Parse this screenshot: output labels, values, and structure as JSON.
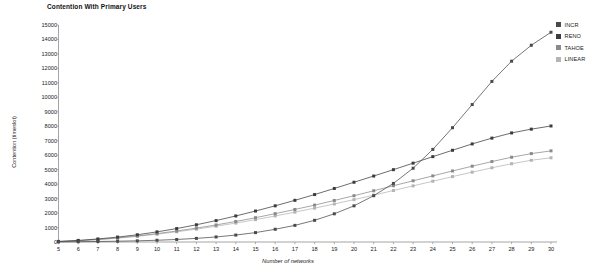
{
  "chart_data": {
    "type": "line",
    "title": "Contention With Primary Users",
    "xlabel": "Number of networks",
    "ylabel": "Contention (timeslot)",
    "xlim": [
      5,
      30
    ],
    "ylim": [
      0,
      15000
    ],
    "ytick_step": 1000,
    "grid": false,
    "legend_position": "top-right",
    "x": [
      5,
      6,
      7,
      8,
      9,
      10,
      11,
      12,
      13,
      14,
      15,
      16,
      17,
      18,
      19,
      20,
      21,
      22,
      23,
      24,
      25,
      26,
      27,
      28,
      29,
      30
    ],
    "xticks": [
      "5",
      "6",
      "7",
      "8",
      "9",
      "10",
      "11",
      "12",
      "13",
      "14",
      "15",
      "16",
      "17",
      "18",
      "19",
      "20",
      "21",
      "22",
      "23",
      "24",
      "25",
      "26",
      "27",
      "28",
      "29",
      "30"
    ],
    "yticks": [
      "0",
      "1000",
      "2000",
      "3000",
      "4000",
      "5000",
      "6000",
      "7000",
      "8000",
      "9000",
      "10000",
      "11000",
      "12000",
      "13000",
      "14000",
      "15000"
    ],
    "series": [
      {
        "name": "INCR",
        "color": "#4a4a4a",
        "marker": "square",
        "values": [
          10,
          20,
          35,
          55,
          80,
          120,
          175,
          250,
          350,
          480,
          650,
          880,
          1150,
          1500,
          1950,
          2500,
          3200,
          4050,
          5100,
          6400,
          7900,
          9500,
          11100,
          12500,
          13600,
          14500
        ]
      },
      {
        "name": "RENO",
        "color": "#3c3c3c",
        "marker": "square",
        "values": [
          40,
          110,
          210,
          340,
          500,
          700,
          930,
          1190,
          1480,
          1800,
          2140,
          2500,
          2880,
          3280,
          3700,
          4130,
          4560,
          5000,
          5450,
          5900,
          6340,
          6780,
          7180,
          7540,
          7800,
          8020
        ]
      },
      {
        "name": "TAHOE",
        "color": "#8a8a8a",
        "marker": "square",
        "values": [
          30,
          90,
          175,
          285,
          420,
          580,
          760,
          960,
          1180,
          1420,
          1680,
          1960,
          2250,
          2550,
          2870,
          3200,
          3540,
          3890,
          4230,
          4570,
          4910,
          5240,
          5560,
          5860,
          6110,
          6300
        ]
      },
      {
        "name": "LINEAR",
        "color": "#b4b4b4",
        "marker": "square",
        "values": [
          25,
          80,
          160,
          265,
          390,
          540,
          705,
          890,
          1090,
          1310,
          1545,
          1800,
          2065,
          2340,
          2630,
          2930,
          3240,
          3560,
          3880,
          4200,
          4520,
          4830,
          5130,
          5410,
          5650,
          5820
        ]
      }
    ]
  },
  "legend": {
    "items": [
      {
        "label": "INCR"
      },
      {
        "label": "RENO"
      },
      {
        "label": "TAHOE"
      },
      {
        "label": "LINEAR"
      }
    ]
  },
  "axis_color": "#9a9a9a"
}
